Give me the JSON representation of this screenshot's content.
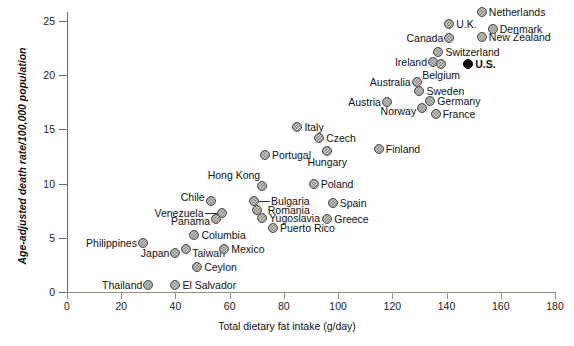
{
  "chart_data": {
    "type": "scatter",
    "title": "",
    "xlabel": "Total dietary fat intake (g/day)",
    "ylabel": "Age-adjusted death rate/100,000 population",
    "xlim": [
      0,
      180
    ],
    "ylim": [
      0,
      25
    ],
    "xticks": [
      0,
      20,
      40,
      60,
      80,
      100,
      120,
      140,
      160,
      180
    ],
    "yticks": [
      0,
      5,
      10,
      15,
      20,
      25
    ],
    "grid": false,
    "legend": null,
    "highlight_color": "#111111",
    "marker_color": "#a9a9a4",
    "points": [
      {
        "label": "Thailand",
        "x": 30,
        "y": 0.6,
        "highlight": false,
        "lab_dx": -6,
        "lab_dy": 0,
        "anchor": "right"
      },
      {
        "label": "El Salvador",
        "x": 40,
        "y": 0.6,
        "highlight": false,
        "lab_dx": 7,
        "lab_dy": 0,
        "anchor": "left"
      },
      {
        "label": "Philippines",
        "x": 28,
        "y": 4.5,
        "highlight": false,
        "lab_dx": -6,
        "lab_dy": 0,
        "anchor": "right"
      },
      {
        "label": "Japan",
        "x": 40,
        "y": 3.6,
        "highlight": false,
        "lab_dx": -6,
        "lab_dy": 0,
        "anchor": "right"
      },
      {
        "label": "Taiwan",
        "x": 44,
        "y": 4.0,
        "highlight": false,
        "lab_dx": 6,
        "lab_dy": 4,
        "anchor": "left"
      },
      {
        "label": "Ceylon",
        "x": 48,
        "y": 2.3,
        "highlight": false,
        "lab_dx": 7,
        "lab_dy": 0,
        "anchor": "left"
      },
      {
        "label": "Columbia",
        "x": 47,
        "y": 5.3,
        "highlight": false,
        "lab_dx": 7,
        "lab_dy": 0,
        "anchor": "left"
      },
      {
        "label": "Mexico",
        "x": 58,
        "y": 4.0,
        "highlight": false,
        "lab_dx": 7,
        "lab_dy": 0,
        "anchor": "left"
      },
      {
        "label": "Chile",
        "x": 53,
        "y": 8.4,
        "highlight": false,
        "lab_dx": -6,
        "lab_dy": -4,
        "anchor": "right"
      },
      {
        "label": "Venezuela",
        "x": 57,
        "y": 7.3,
        "highlight": false,
        "lab_dx": -18,
        "lab_dy": 0,
        "anchor": "right"
      },
      {
        "label": "Panama",
        "x": 55,
        "y": 6.7,
        "highlight": false,
        "lab_dx": -6,
        "lab_dy": 2,
        "anchor": "right"
      },
      {
        "label": "Hong Kong",
        "x": 72,
        "y": 9.8,
        "highlight": false,
        "lab_dx": -2,
        "lab_dy": -11,
        "anchor": "right"
      },
      {
        "label": "Bulgaria",
        "x": 69,
        "y": 8.4,
        "highlight": false,
        "lab_dx": 17,
        "lab_dy": 0,
        "anchor": "left"
      },
      {
        "label": "Romania",
        "x": 70,
        "y": 7.6,
        "highlight": false,
        "lab_dx": 11,
        "lab_dy": 0,
        "anchor": "left"
      },
      {
        "label": "Yugoslavia",
        "x": 72,
        "y": 6.8,
        "highlight": false,
        "lab_dx": 7,
        "lab_dy": 0,
        "anchor": "left"
      },
      {
        "label": "Puerto Rico",
        "x": 76,
        "y": 5.9,
        "highlight": false,
        "lab_dx": 7,
        "lab_dy": 0,
        "anchor": "left"
      },
      {
        "label": "Portugal",
        "x": 73,
        "y": 12.6,
        "highlight": false,
        "lab_dx": 7,
        "lab_dy": 0,
        "anchor": "left"
      },
      {
        "label": "Italy",
        "x": 85,
        "y": 15.2,
        "highlight": false,
        "lab_dx": 7,
        "lab_dy": 0,
        "anchor": "left"
      },
      {
        "label": "Czech",
        "x": 93,
        "y": 14.2,
        "highlight": false,
        "lab_dx": 7,
        "lab_dy": 0,
        "anchor": "left"
      },
      {
        "label": "Hungary",
        "x": 96,
        "y": 13.0,
        "highlight": false,
        "lab_dx": 0,
        "lab_dy": 11,
        "anchor": "center"
      },
      {
        "label": "Finland",
        "x": 115,
        "y": 13.2,
        "highlight": false,
        "lab_dx": 7,
        "lab_dy": 0,
        "anchor": "left"
      },
      {
        "label": "Poland",
        "x": 91,
        "y": 10.0,
        "highlight": false,
        "lab_dx": 7,
        "lab_dy": 0,
        "anchor": "left"
      },
      {
        "label": "Spain",
        "x": 98,
        "y": 8.2,
        "highlight": false,
        "lab_dx": 7,
        "lab_dy": 0,
        "anchor": "left"
      },
      {
        "label": "Greece",
        "x": 96,
        "y": 6.7,
        "highlight": false,
        "lab_dx": 7,
        "lab_dy": 0,
        "anchor": "left"
      },
      {
        "label": "Austria",
        "x": 118,
        "y": 17.5,
        "highlight": false,
        "lab_dx": -6,
        "lab_dy": 0,
        "anchor": "right"
      },
      {
        "label": "Norway",
        "x": 131,
        "y": 17.0,
        "highlight": false,
        "lab_dx": -6,
        "lab_dy": 3,
        "anchor": "right"
      },
      {
        "label": "France",
        "x": 136,
        "y": 16.4,
        "highlight": false,
        "lab_dx": 7,
        "lab_dy": 0,
        "anchor": "left"
      },
      {
        "label": "Germany",
        "x": 134,
        "y": 17.6,
        "highlight": false,
        "lab_dx": 7,
        "lab_dy": 0,
        "anchor": "left"
      },
      {
        "label": "Sweden",
        "x": 130,
        "y": 18.5,
        "highlight": false,
        "lab_dx": 7,
        "lab_dy": 0,
        "anchor": "left"
      },
      {
        "label": "Australia",
        "x": 129,
        "y": 19.4,
        "highlight": false,
        "lab_dx": -6,
        "lab_dy": 0,
        "anchor": "right"
      },
      {
        "label": "Ireland",
        "x": 135,
        "y": 21.2,
        "highlight": false,
        "lab_dx": -6,
        "lab_dy": 0,
        "anchor": "right"
      },
      {
        "label": "Belgium",
        "x": 138,
        "y": 21.0,
        "highlight": false,
        "lab_dx": 0,
        "lab_dy": 11,
        "anchor": "center"
      },
      {
        "label": "Switzerland",
        "x": 137,
        "y": 22.1,
        "highlight": false,
        "lab_dx": 7,
        "lab_dy": 0,
        "anchor": "left"
      },
      {
        "label": "U.S.",
        "x": 148,
        "y": 21.0,
        "highlight": true,
        "lab_dx": 7,
        "lab_dy": 0,
        "anchor": "left"
      },
      {
        "label": "Canada",
        "x": 141,
        "y": 23.4,
        "highlight": false,
        "lab_dx": -6,
        "lab_dy": 0,
        "anchor": "right"
      },
      {
        "label": "U.K.",
        "x": 141,
        "y": 24.7,
        "highlight": false,
        "lab_dx": 7,
        "lab_dy": 0,
        "anchor": "left"
      },
      {
        "label": "New Zealand",
        "x": 153,
        "y": 23.5,
        "highlight": false,
        "lab_dx": 7,
        "lab_dy": 0,
        "anchor": "left"
      },
      {
        "label": "Denmark",
        "x": 157,
        "y": 24.3,
        "highlight": false,
        "lab_dx": 7,
        "lab_dy": 0,
        "anchor": "left"
      },
      {
        "label": "Netherlands",
        "x": 153,
        "y": 25.8,
        "highlight": false,
        "lab_dx": 7,
        "lab_dy": 0,
        "anchor": "left"
      }
    ],
    "leaders": [
      {
        "from_label": "Venezuela",
        "x1": 57,
        "y1": 7.3,
        "x2": 51,
        "y2": 7.3
      },
      {
        "from_label": "Bulgaria",
        "x1": 69,
        "y1": 8.4,
        "x2": 75,
        "y2": 8.4
      }
    ]
  }
}
